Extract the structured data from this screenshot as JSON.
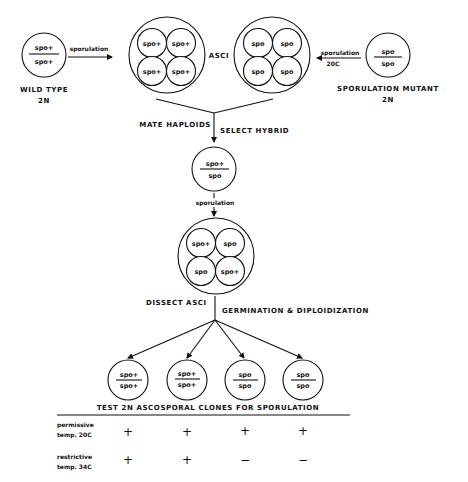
{
  "top": {
    "wild_type": {
      "top_allele": "spo+",
      "bottom_allele": "spo+",
      "label": "WILD TYPE",
      "ploidy": "2N"
    },
    "wild_arrow": "sporulation",
    "left_ascus_spores": [
      "spo+",
      "spo+",
      "spo+",
      "spo+"
    ],
    "asci_label": "ASCI",
    "right_ascus_spores": [
      "spo",
      "spo",
      "spo",
      "spo"
    ],
    "mutant_arrow": "sporulation",
    "mutant_arrow_temp": "20C",
    "mutant": {
      "top_allele": "spo",
      "bottom_allele": "spo",
      "label": "SPORULATION MUTANT",
      "ploidy": "2N"
    }
  },
  "mating": {
    "left_label": "MATE HAPLOIDS",
    "right_label": "SELECT HYBRID"
  },
  "hybrid": {
    "top_allele": "spo+",
    "bottom_allele": "spo"
  },
  "hybrid_arrow": "sporulation",
  "hybrid_ascus_spores": [
    "spo+",
    "spo",
    "spo",
    "spo+"
  ],
  "dissect": {
    "left_label": "DISSECT ASCI",
    "right_label": "GERMINATION & DIPLOIDIZATION"
  },
  "clones": [
    {
      "top": "spo+",
      "bottom": "spo+"
    },
    {
      "top": "spo+",
      "bottom": "spo+"
    },
    {
      "top": "spo",
      "bottom": "spo"
    },
    {
      "top": "spo",
      "bottom": "spo"
    }
  ],
  "table": {
    "header": "TEST 2N ASCOSPORAL CLONES FOR SPORULATION",
    "rows": [
      {
        "label_1": "permissive",
        "label_2": "temp. 20C",
        "values": [
          "+",
          "+",
          "+",
          "+"
        ]
      },
      {
        "label_1": "restrictive",
        "label_2": "temp. 34C",
        "values": [
          "+",
          "+",
          "−",
          "−"
        ]
      }
    ]
  }
}
